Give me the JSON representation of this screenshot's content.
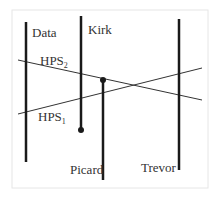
{
  "diagram": {
    "agents": [
      {
        "name": "Data"
      },
      {
        "name": "Kirk"
      },
      {
        "name": "Picard"
      },
      {
        "name": "Trevor"
      }
    ],
    "hyperplanes": [
      {
        "base": "HPS",
        "subscript": "2"
      },
      {
        "base": "HPS",
        "subscript": "1"
      }
    ],
    "colors": {
      "line": "#1a1a1a",
      "thin_line": "#333333",
      "frame": "#e6e6e6"
    }
  }
}
